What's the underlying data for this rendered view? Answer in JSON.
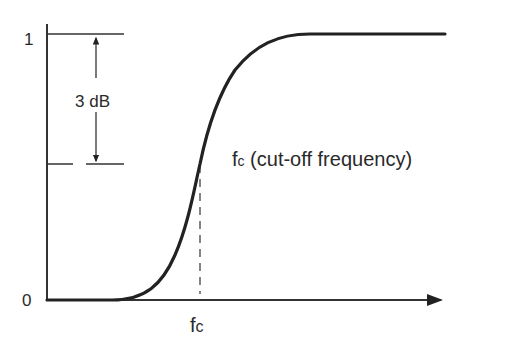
{
  "diagram": {
    "type": "filter-response",
    "y_axis": {
      "tick_top": "1",
      "tick_bottom": "0"
    },
    "x_axis": {
      "tick": "fc"
    },
    "annotation_3db": "3 dB",
    "cutoff_label_main": "f",
    "cutoff_label_sub": "c",
    "cutoff_label_rest": " (cut-off frequency)",
    "x_tick_main": "f",
    "x_tick_sub": "c",
    "colors": {
      "line": "#222222",
      "text": "#2a2a2a",
      "background": "#ffffff"
    }
  }
}
